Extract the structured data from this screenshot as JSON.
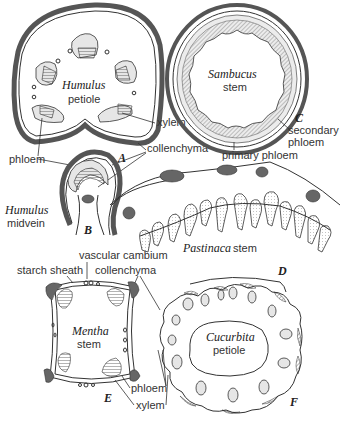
{
  "figure": {
    "panels": [
      {
        "letter": "A",
        "name": "Humulus",
        "part": "petiole"
      },
      {
        "letter": "B",
        "name": "Humulus",
        "part": "midvein"
      },
      {
        "letter": "C",
        "name": "Sambucus",
        "part": "stem"
      },
      {
        "letter": "D",
        "name": "Pastinaca",
        "part": "stem"
      },
      {
        "letter": "E",
        "name": "Mentha",
        "part": "stem"
      },
      {
        "letter": "F",
        "name": "Cucurbita",
        "part": "petiole"
      }
    ],
    "labels": {
      "xylem_a": "xylem",
      "phloem_a": "phloem",
      "collenchyma_a": "collenchyma",
      "secondary_phloem_1": "secondary",
      "secondary_phloem_2": "phloem",
      "primary_phloem": "primary phloem",
      "vascular_cambium": "vascular cambium",
      "starch_sheath": "starch sheath",
      "collenchyma_e": "collenchyma",
      "phloem_e": "phloem",
      "xylem_e": "xylem"
    }
  }
}
